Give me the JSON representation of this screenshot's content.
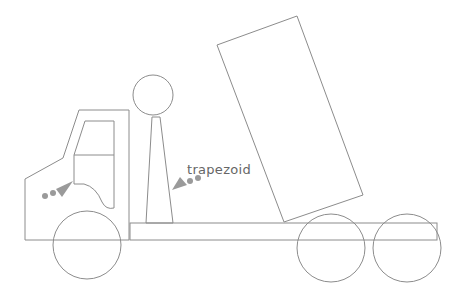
{
  "diagram": {
    "labels": [
      {
        "id": "trapezoid",
        "text": "trapezoid",
        "x": 187,
        "y": 176
      }
    ],
    "colors": {
      "line": "#8c8c8c",
      "arrow": "#9a9a9a",
      "text": "#666666",
      "background": "#ffffff"
    }
  }
}
